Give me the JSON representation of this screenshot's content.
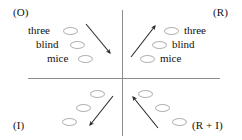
{
  "figure": {
    "quadrants": {
      "top_left": {
        "label": "(O)",
        "words": [
          "three",
          "blind",
          "mice"
        ],
        "ellipse_count": 3
      },
      "top_right": {
        "label": "(R)",
        "words": [
          "three",
          "blind",
          "mice"
        ],
        "ellipse_count": 3
      },
      "bottom_left": {
        "label": "(I)",
        "words": [],
        "ellipse_count": 3
      },
      "bottom_right": {
        "label": "(R + I)",
        "words": [],
        "ellipse_count": 3
      }
    },
    "arrows": [
      {
        "name": "arrow-top-left-inward",
        "direction": "down-right"
      },
      {
        "name": "arrow-top-right-outward",
        "direction": "up-right"
      },
      {
        "name": "arrow-bottom-left-outward",
        "direction": "down-left"
      },
      {
        "name": "arrow-bottom-right-inward",
        "direction": "up-left"
      }
    ],
    "colors": {
      "axis": "#8c8c8c",
      "ellipse_outline": "#b4b4b4",
      "text": "#101010",
      "arrow": "#2a2a2a",
      "background": "#ffffff"
    }
  }
}
